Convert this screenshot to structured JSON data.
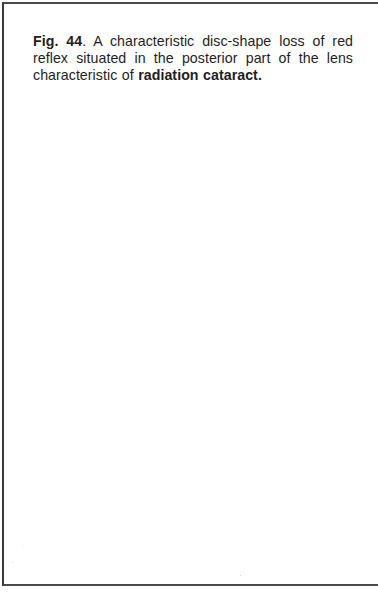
{
  "figure": {
    "label": "Fig. 44",
    "label_suffix": ".",
    "caption_text": " A characteristic disc-shape loss of red reflex situated in the posterior part of the lens characteristic of ",
    "emphasis": "radiation cataract",
    "end_punctuation": "."
  }
}
